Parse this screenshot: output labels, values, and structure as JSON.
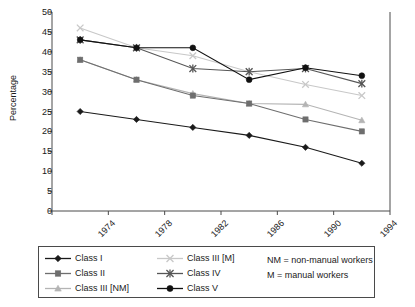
{
  "chart_data": {
    "type": "line",
    "title": "",
    "xlabel": "",
    "ylabel": "Percentage",
    "categories": [
      "1974",
      "1978",
      "1982",
      "1986",
      "1990",
      "1994"
    ],
    "ylim": [
      0,
      50
    ],
    "yticks": [
      0,
      5,
      10,
      15,
      20,
      25,
      30,
      35,
      40,
      45,
      50
    ],
    "grid": false,
    "legend_position": "bottom",
    "series": [
      {
        "name": "Class I",
        "marker": "diamond",
        "color": "#1a1a1a",
        "values": [
          25,
          23,
          21,
          19,
          16,
          12
        ]
      },
      {
        "name": "Class II",
        "marker": "square",
        "color": "#6e6e6e",
        "values": [
          38,
          33,
          29,
          27,
          23,
          20
        ]
      },
      {
        "name": "Class III [NM]",
        "marker": "triangle",
        "color": "#b4b4b4",
        "values": [
          38,
          33,
          29.5,
          27,
          26.8,
          22.8
        ]
      },
      {
        "name": "Class III [M]",
        "marker": "cross",
        "color": "#c8c8c8",
        "values": [
          46,
          41,
          39,
          35,
          31.8,
          29
        ]
      },
      {
        "name": "Class IV",
        "marker": "asterisk",
        "color": "#565656",
        "values": [
          43,
          41,
          35.8,
          35,
          35.8,
          32
        ]
      },
      {
        "name": "Class V",
        "marker": "circle",
        "color": "#111111",
        "values": [
          43,
          41,
          41,
          33,
          36,
          34
        ]
      }
    ],
    "notes": [
      "NM = non-manual workers",
      "M = manual workers"
    ]
  },
  "legend": {
    "column_1": [
      "Class I",
      "Class II",
      "Class III [NM]"
    ],
    "column_2": [
      "Class III [M]",
      "Class IV",
      "Class V"
    ],
    "column_3": [
      "NM = non-manual workers",
      "M = manual workers"
    ]
  }
}
